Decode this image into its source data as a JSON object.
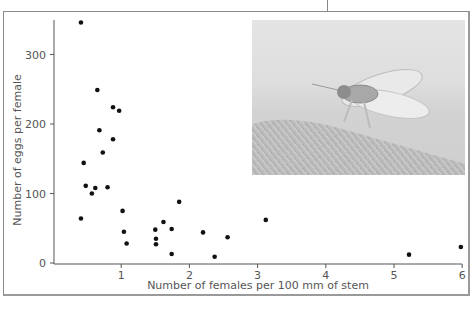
{
  "chart_data": {
    "type": "scatter",
    "title": "",
    "xlabel": "Number of females per 100 mm of stem",
    "ylabel": "Number of eggs per female",
    "xlim": [
      0,
      6
    ],
    "ylim": [
      0,
      350
    ],
    "xticks": [
      1,
      2,
      3,
      4,
      5,
      6
    ],
    "yticks": [
      0,
      100,
      200,
      300
    ],
    "grid": false,
    "legend": null,
    "inset": "photograph of insect on plant stem (upper right)",
    "points": [
      {
        "x": 0.41,
        "y": 346
      },
      {
        "x": 0.65,
        "y": 249
      },
      {
        "x": 0.88,
        "y": 224
      },
      {
        "x": 0.97,
        "y": 219
      },
      {
        "x": 0.68,
        "y": 191
      },
      {
        "x": 0.88,
        "y": 178
      },
      {
        "x": 0.73,
        "y": 159
      },
      {
        "x": 0.45,
        "y": 144
      },
      {
        "x": 0.48,
        "y": 111
      },
      {
        "x": 0.62,
        "y": 108
      },
      {
        "x": 0.8,
        "y": 109
      },
      {
        "x": 0.57,
        "y": 100
      },
      {
        "x": 0.41,
        "y": 64
      },
      {
        "x": 1.02,
        "y": 75
      },
      {
        "x": 1.04,
        "y": 45
      },
      {
        "x": 1.08,
        "y": 28
      },
      {
        "x": 1.5,
        "y": 48
      },
      {
        "x": 1.51,
        "y": 35
      },
      {
        "x": 1.51,
        "y": 27
      },
      {
        "x": 1.62,
        "y": 59
      },
      {
        "x": 1.74,
        "y": 49
      },
      {
        "x": 1.85,
        "y": 88
      },
      {
        "x": 1.74,
        "y": 13
      },
      {
        "x": 2.2,
        "y": 44
      },
      {
        "x": 2.37,
        "y": 9
      },
      {
        "x": 2.56,
        "y": 37
      },
      {
        "x": 3.12,
        "y": 62
      },
      {
        "x": 5.22,
        "y": 12
      },
      {
        "x": 5.98,
        "y": 23
      }
    ]
  },
  "axes": {
    "xlabel": "Number of females per 100 mm of stem",
    "ylabel": "Number of eggs per female",
    "xtick_labels": [
      "1",
      "2",
      "3",
      "4",
      "5",
      "6"
    ],
    "ytick_labels": [
      "0",
      "100",
      "200",
      "300"
    ]
  },
  "colors": {
    "point": "#111111",
    "axis": "#555555",
    "frame": "#8a8a8a"
  }
}
